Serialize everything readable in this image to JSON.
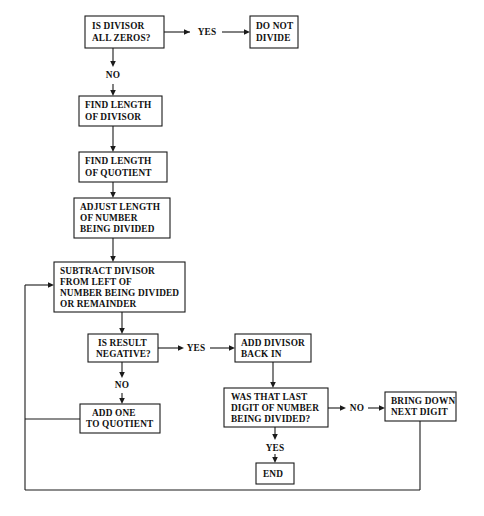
{
  "diagram": {
    "background_color": "#ffffff",
    "line_color": "#1b1b1b",
    "text_color": "#111111",
    "nodes": {
      "is_divisor_all_zeros": {
        "id": "is-divisor-all-zeros",
        "shape": "rectangle",
        "lines": [
          "IS DIVISOR",
          "ALL ZEROS?"
        ],
        "line1": "IS DIVISOR",
        "line2": "ALL ZEROS?",
        "x": 85,
        "y": 16,
        "w": 79,
        "h": 32
      },
      "do_not_divide": {
        "id": "do-not-divide",
        "shape": "rectangle",
        "lines": [
          "DO NOT",
          "DIVIDE"
        ],
        "line1": "DO NOT",
        "line2": "DIVIDE",
        "x": 250,
        "y": 16,
        "w": 48,
        "h": 32
      },
      "find_length_of_divisor": {
        "id": "find-length-of-divisor",
        "shape": "rectangle",
        "lines": [
          "FIND LENGTH",
          "OF DIVISOR"
        ],
        "line1": "FIND LENGTH",
        "line2": "OF DIVISOR",
        "x": 79,
        "y": 96,
        "w": 83,
        "h": 30
      },
      "find_length_of_quotient": {
        "id": "find-length-of-quotient",
        "shape": "rectangle",
        "lines": [
          "FIND LENGTH",
          "OF QUOTIENT"
        ],
        "line1": "FIND LENGTH",
        "line2": "OF QUOTIENT",
        "x": 79,
        "y": 152,
        "w": 88,
        "h": 30
      },
      "adjust_length": {
        "id": "adjust-length-of-number-being-divided",
        "shape": "rectangle",
        "lines": [
          "ADJUST LENGTH",
          "OF NUMBER",
          "BEING DIVIDED"
        ],
        "line1": "ADJUST LENGTH",
        "line2": "OF NUMBER",
        "line3": "BEING DIVIDED",
        "x": 74,
        "y": 198,
        "w": 96,
        "h": 40
      },
      "subtract_divisor": {
        "id": "subtract-divisor-from-left",
        "shape": "rectangle",
        "lines": [
          "SUBTRACT DIVISOR",
          "FROM LEFT OF",
          "NUMBER BEING DIVIDED",
          "OR REMAINDER"
        ],
        "line1": "SUBTRACT DIVISOR",
        "line2": "FROM LEFT OF",
        "line3": "NUMBER BEING DIVIDED",
        "line4": "OR REMAINDER",
        "x": 54,
        "y": 262,
        "w": 131,
        "h": 50
      },
      "is_result_negative": {
        "id": "is-result-negative",
        "shape": "rectangle",
        "lines": [
          "IS RESULT",
          "NEGATIVE?"
        ],
        "line1": "IS RESULT",
        "line2": "NEGATIVE?",
        "x": 88,
        "y": 334,
        "w": 70,
        "h": 28
      },
      "add_divisor_back_in": {
        "id": "add-divisor-back-in",
        "shape": "rectangle",
        "lines": [
          "ADD DIVISOR",
          "BACK IN"
        ],
        "line1": "ADD DIVISOR",
        "line2": "BACK IN",
        "x": 235,
        "y": 334,
        "w": 76,
        "h": 28
      },
      "add_one_to_quotient": {
        "id": "add-one-to-quotient",
        "shape": "rectangle",
        "lines": [
          "ADD ONE",
          "TO QUOTIENT"
        ],
        "line1": "ADD ONE",
        "line2": "TO QUOTIENT",
        "x": 80,
        "y": 404,
        "w": 80,
        "h": 29
      },
      "was_that_last_digit": {
        "id": "was-that-last-digit-of-number-being-divided",
        "shape": "rectangle",
        "lines": [
          "WAS THAT LAST",
          "DIGIT OF NUMBER",
          "BEING DIVIDED?"
        ],
        "line1": "WAS THAT LAST",
        "line2": "DIGIT OF NUMBER",
        "line3": "BEING DIVIDED?",
        "x": 224,
        "y": 388,
        "w": 104,
        "h": 39
      },
      "bring_down_next_digit": {
        "id": "bring-down-next-digit",
        "shape": "rectangle",
        "lines": [
          "BRING DOWN",
          "NEXT DIGIT"
        ],
        "line1": "BRING DOWN",
        "line2": "NEXT DIGIT",
        "x": 385,
        "y": 392,
        "w": 71,
        "h": 29
      },
      "end": {
        "id": "end",
        "shape": "rectangle",
        "lines": [
          "END"
        ],
        "line1": "END",
        "x": 256,
        "y": 463,
        "w": 38,
        "h": 21
      }
    },
    "edge_labels": {
      "yes_top": {
        "text": "YES",
        "x": 207,
        "y": 35
      },
      "no_top": {
        "text": "NO",
        "x": 113,
        "y": 78
      },
      "yes_negative": {
        "text": "YES",
        "x": 196,
        "y": 351
      },
      "no_negative": {
        "text": "NO",
        "x": 113,
        "y": 388
      },
      "no_last_digit": {
        "text": "NO",
        "x": 356,
        "y": 409
      },
      "yes_last_digit": {
        "text": "YES",
        "x": 275,
        "y": 449
      }
    },
    "edges": [
      {
        "name": "is-divisor-to-do-not-divide",
        "from": "is_divisor_all_zeros",
        "to": "do_not_divide",
        "label": "YES"
      },
      {
        "name": "is-divisor-to-find-length-divisor",
        "from": "is_divisor_all_zeros",
        "to": "find_length_of_divisor",
        "label": "NO"
      },
      {
        "name": "find-divisor-to-find-quotient",
        "from": "find_length_of_divisor",
        "to": "find_length_of_quotient",
        "label": ""
      },
      {
        "name": "find-quotient-to-adjust-length",
        "from": "find_length_of_quotient",
        "to": "adjust_length",
        "label": ""
      },
      {
        "name": "adjust-length-to-subtract",
        "from": "adjust_length",
        "to": "subtract_divisor",
        "label": ""
      },
      {
        "name": "subtract-to-is-result-negative",
        "from": "subtract_divisor",
        "to": "is_result_negative",
        "label": ""
      },
      {
        "name": "negative-yes-to-add-divisor-back",
        "from": "is_result_negative",
        "to": "add_divisor_back_in",
        "label": "YES"
      },
      {
        "name": "negative-no-to-add-one",
        "from": "is_result_negative",
        "to": "add_one_to_quotient",
        "label": "NO"
      },
      {
        "name": "add-divisor-back-to-was-that-last",
        "from": "add_divisor_back_in",
        "to": "was_that_last_digit",
        "label": ""
      },
      {
        "name": "last-digit-no-to-bring-down",
        "from": "was_that_last_digit",
        "to": "bring_down_next_digit",
        "label": "NO"
      },
      {
        "name": "last-digit-yes-to-end",
        "from": "was_that_last_digit",
        "to": "end",
        "label": "YES"
      },
      {
        "name": "add-one-loopback-to-subtract",
        "from": "add_one_to_quotient",
        "to": "subtract_divisor",
        "label": ""
      },
      {
        "name": "bring-down-loopback-to-subtract",
        "from": "bring_down_next_digit",
        "to": "subtract_divisor",
        "label": ""
      }
    ]
  }
}
